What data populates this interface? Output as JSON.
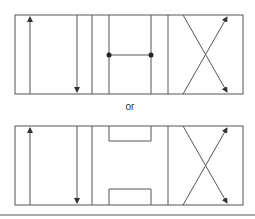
{
  "diagram": {
    "type": "valve-symbol-alternatives",
    "separator_text": "or",
    "colors": {
      "line": "#555555",
      "background": "#ffffff",
      "text": "#333333"
    },
    "symbols": [
      {
        "id": "top",
        "variant": "connected-center-with-junction-dots",
        "box": {
          "x": 15,
          "y": 15,
          "w": 228,
          "h": 79
        },
        "envelopes": [
          "flow-up-down",
          "center-connected",
          "crossed-flow"
        ]
      },
      {
        "id": "bottom",
        "variant": "center-with-blocked-ports",
        "box": {
          "x": 15,
          "y": 126,
          "w": 228,
          "h": 79
        },
        "envelopes": [
          "flow-up-down",
          "center-blocked",
          "crossed-flow"
        ]
      }
    ]
  }
}
